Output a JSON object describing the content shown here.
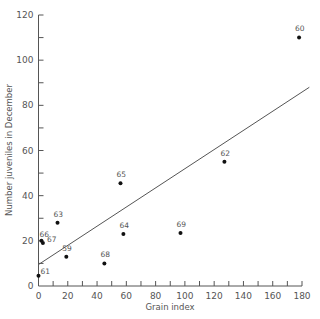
{
  "chart_data": {
    "type": "scatter",
    "title": "",
    "xlabel": "Grain index",
    "ylabel": "Number juveniles in December",
    "xlim": [
      0,
      180
    ],
    "ylim": [
      0,
      120
    ],
    "x_ticks": [
      0,
      20,
      40,
      60,
      80,
      100,
      120,
      140,
      160,
      180
    ],
    "y_ticks": [
      0,
      20,
      40,
      60,
      80,
      100,
      120
    ],
    "grid": false,
    "legend": null,
    "points": [
      {
        "label": "60",
        "x": 178,
        "y": 110
      },
      {
        "label": "61",
        "x": 0,
        "y": 4.5
      },
      {
        "label": "62",
        "x": 127,
        "y": 55
      },
      {
        "label": "63",
        "x": 13,
        "y": 28
      },
      {
        "label": "64",
        "x": 58,
        "y": 23
      },
      {
        "label": "65",
        "x": 56,
        "y": 45.5
      },
      {
        "label": "66",
        "x": 2,
        "y": 20
      },
      {
        "label": "67",
        "x": 3,
        "y": 19
      },
      {
        "label": "68",
        "x": 45,
        "y": 10
      },
      {
        "label": "69",
        "x": 97,
        "y": 23.5
      },
      {
        "label": "59",
        "x": 19,
        "y": 13
      }
    ],
    "regression_line": {
      "x": [
        0,
        185
      ],
      "y": [
        9.5,
        88
      ]
    },
    "colors": {
      "axis": "#555555",
      "points": "#111111",
      "line": "#555555"
    }
  }
}
